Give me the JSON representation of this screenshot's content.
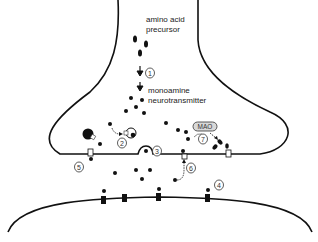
{
  "diagram": {
    "type": "monoamine-synapse",
    "labels": {
      "precursor_line1": "amino acid",
      "precursor_line2": "precursor",
      "transmitter_line1": "monoamine",
      "transmitter_line2": "neurotransmitter",
      "enzyme": "MAO"
    },
    "steps": [
      {
        "id": "1",
        "label": "1",
        "meaning": "synthesis"
      },
      {
        "id": "2",
        "label": "2",
        "meaning": "vesicular storage"
      },
      {
        "id": "3",
        "label": "3",
        "meaning": "release (exocytosis)"
      },
      {
        "id": "4",
        "label": "4",
        "meaning": "postsynaptic receptor binding"
      },
      {
        "id": "5",
        "label": "5",
        "meaning": "presynaptic autoreceptor"
      },
      {
        "id": "6",
        "label": "6",
        "meaning": "reuptake"
      },
      {
        "id": "7",
        "label": "7",
        "meaning": "MAO degradation"
      }
    ],
    "colors": {
      "line": "#111111",
      "background": "#ffffff",
      "enzyme_fill": "#d8d8d8"
    }
  }
}
